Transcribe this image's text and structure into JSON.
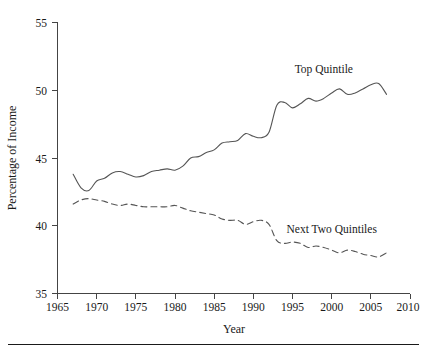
{
  "chart_data": {
    "type": "line",
    "title": "",
    "xlabel": "Year",
    "ylabel": "Percentage of Income",
    "xlim": [
      1965,
      2010
    ],
    "ylim": [
      35,
      55
    ],
    "xticks": [
      1965,
      1970,
      1975,
      1980,
      1985,
      1990,
      1995,
      2000,
      2005,
      2010
    ],
    "yticks": [
      35,
      40,
      45,
      50,
      55
    ],
    "grid": false,
    "legend_position": "inline-annotations",
    "annotations": [
      {
        "text": "Top Quintile",
        "x": 1999,
        "y": 51.3
      },
      {
        "text": "Next Two Quintiles",
        "x": 2000,
        "y": 39.5
      }
    ],
    "series": [
      {
        "name": "Top Quintile",
        "style": "solid",
        "color": "#555555",
        "x": [
          1967,
          1968,
          1969,
          1970,
          1971,
          1972,
          1973,
          1974,
          1975,
          1976,
          1977,
          1978,
          1979,
          1980,
          1981,
          1982,
          1983,
          1984,
          1985,
          1986,
          1987,
          1988,
          1989,
          1990,
          1991,
          1992,
          1993,
          1994,
          1995,
          1996,
          1997,
          1998,
          1999,
          2000,
          2001,
          2002,
          2003,
          2004,
          2005,
          2006,
          2007
        ],
        "values": [
          43.8,
          42.8,
          42.6,
          43.3,
          43.5,
          43.9,
          44.0,
          43.8,
          43.6,
          43.7,
          44.0,
          44.1,
          44.2,
          44.1,
          44.4,
          45.0,
          45.1,
          45.4,
          45.6,
          46.1,
          46.2,
          46.3,
          46.8,
          46.6,
          46.5,
          46.9,
          48.9,
          49.1,
          48.7,
          49.0,
          49.4,
          49.2,
          49.4,
          49.8,
          50.1,
          49.7,
          49.8,
          50.1,
          50.4,
          50.5,
          49.7
        ]
      },
      {
        "name": "Next Two Quintiles",
        "style": "dashed",
        "color": "#555555",
        "x": [
          1967,
          1968,
          1969,
          1970,
          1971,
          1972,
          1973,
          1974,
          1975,
          1976,
          1977,
          1978,
          1979,
          1980,
          1981,
          1982,
          1983,
          1984,
          1985,
          1986,
          1987,
          1988,
          1989,
          1990,
          1991,
          1992,
          1993,
          1994,
          1995,
          1996,
          1997,
          1998,
          1999,
          2000,
          2001,
          2002,
          2003,
          2004,
          2005,
          2006,
          2007
        ],
        "values": [
          41.6,
          41.9,
          42.0,
          41.9,
          41.8,
          41.6,
          41.5,
          41.6,
          41.5,
          41.4,
          41.4,
          41.4,
          41.4,
          41.5,
          41.3,
          41.1,
          41.0,
          40.9,
          40.8,
          40.5,
          40.4,
          40.4,
          40.1,
          40.3,
          40.4,
          40.1,
          38.9,
          38.7,
          38.8,
          38.7,
          38.4,
          38.5,
          38.4,
          38.2,
          38.0,
          38.2,
          38.1,
          37.9,
          37.8,
          37.7,
          38.0
        ]
      }
    ]
  },
  "figure": {
    "y_axis_title": "Percentage of Income",
    "x_axis_title": "Year",
    "tick_labels_y": [
      "55",
      "50",
      "45",
      "40",
      "35"
    ],
    "tick_labels_x": [
      "1965",
      "1970",
      "1975",
      "1980",
      "1985",
      "1990",
      "1995",
      "2000",
      "2005",
      "2010"
    ],
    "label_top_quintile": "Top Quintile",
    "label_next_two_quintiles": "Next Two Quintiles",
    "colors": {
      "line": "#555555",
      "axis": "#444444",
      "text": "#1a1a1a",
      "rule": "#1a1a1a",
      "background": "#ffffff"
    }
  }
}
